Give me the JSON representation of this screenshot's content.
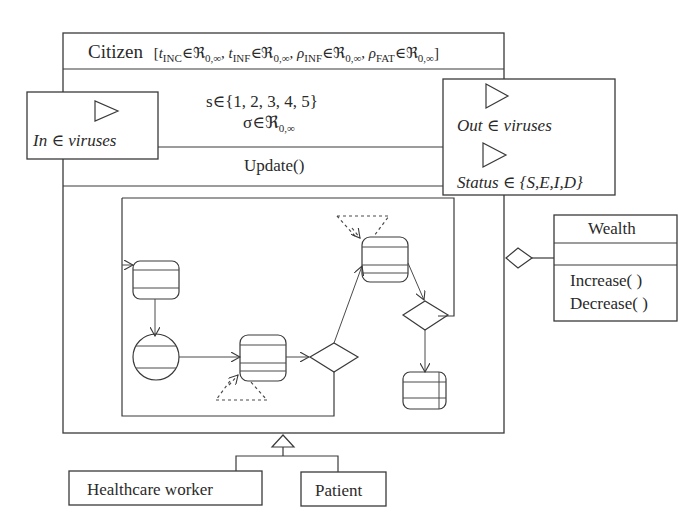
{
  "diagram": {
    "citizen": {
      "name": "Citizen",
      "params": [
        {
          "symbol": "t",
          "sub": "INC",
          "set": "ℜ",
          "set_sub": "0,∞"
        },
        {
          "symbol": "t",
          "sub": "INF",
          "set": "ℜ",
          "set_sub": "0,∞"
        },
        {
          "symbol": "ρ",
          "sub": "INF",
          "set": "ℜ",
          "set_sub": "0,∞"
        },
        {
          "symbol": "ρ",
          "sub": "FAT",
          "set": "ℜ",
          "set_sub": "0,∞"
        }
      ],
      "attributes": {
        "s_line": "s∈{1, 2, 3, 4, 5}",
        "sigma_symbol": "σ∈ℜ",
        "sigma_sub": "0,∞"
      },
      "operation": "Update()"
    },
    "ports": {
      "input": {
        "label": "In ∈ viruses",
        "icon": "triangle-port-icon"
      },
      "outputs": [
        {
          "label": "Out ∈ viruses",
          "icon": "triangle-port-icon"
        },
        {
          "label": "Status ∈ {S,E,I,D}",
          "icon": "triangle-port-icon"
        }
      ]
    },
    "wealth": {
      "name": "Wealth",
      "operations": [
        "Increase( )",
        "Decrease( )"
      ],
      "relation": "aggregation"
    },
    "subclasses": [
      "Healthcare worker",
      "Patient"
    ],
    "relation_to_subclasses": "generalization",
    "colors": {
      "stroke": "#3a3a3a",
      "text": "#2a2a2a",
      "background": "#ffffff"
    }
  }
}
